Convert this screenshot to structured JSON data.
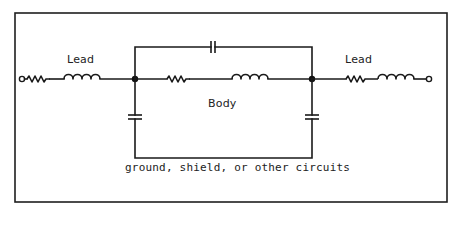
{
  "figure": {
    "labels": {
      "left_lead": "Lead",
      "right_lead": "Lead",
      "body": "Body",
      "ground": "ground, shield, or other circuits"
    },
    "components": [
      {
        "id": "left-terminal",
        "type": "terminal"
      },
      {
        "id": "left-lead-resistor",
        "type": "resistor",
        "group": "Lead"
      },
      {
        "id": "left-lead-inductor",
        "type": "inductor",
        "group": "Lead"
      },
      {
        "id": "left-junction",
        "type": "node"
      },
      {
        "id": "body-parallel-capacitor",
        "type": "capacitor",
        "group": "Body"
      },
      {
        "id": "body-resistor",
        "type": "resistor",
        "group": "Body"
      },
      {
        "id": "body-inductor",
        "type": "inductor",
        "group": "Body"
      },
      {
        "id": "right-junction",
        "type": "node"
      },
      {
        "id": "left-shunt-capacitor",
        "type": "capacitor",
        "to": "ground, shield, or other circuits"
      },
      {
        "id": "right-shunt-capacitor",
        "type": "capacitor",
        "to": "ground, shield, or other circuits"
      },
      {
        "id": "right-lead-resistor",
        "type": "resistor",
        "group": "Lead"
      },
      {
        "id": "right-lead-inductor",
        "type": "inductor",
        "group": "Lead"
      },
      {
        "id": "right-terminal",
        "type": "terminal"
      }
    ],
    "colors": {
      "ink": "#1a1a1a",
      "background": "#ffffff"
    }
  }
}
